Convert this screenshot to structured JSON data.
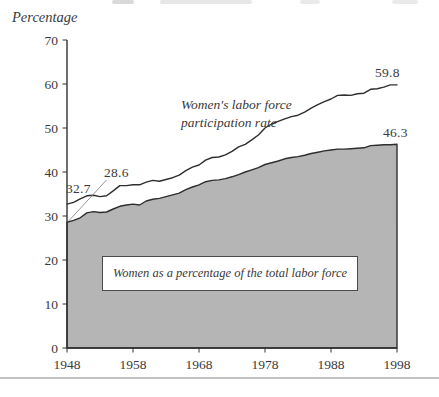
{
  "figure": {
    "ylabel": "Percentage",
    "line_label": "Women's labor force\nparticipation rate",
    "annotations": {
      "line_start": "32.7",
      "area_start": "28.6",
      "line_end": "59.8",
      "area_end": "46.3"
    },
    "caption": "Women as a percentage of the total labor force"
  },
  "chart_data": {
    "type": "area",
    "title": "",
    "xlabel": "",
    "ylabel": "Percentage",
    "xlim": [
      1948,
      1998
    ],
    "ylim": [
      0,
      70
    ],
    "x_start": 1948,
    "x_step": 1,
    "x_label_ticks": [
      1948,
      1958,
      1968,
      1978,
      1988,
      1998
    ],
    "y_ticks": [
      0,
      10,
      20,
      30,
      40,
      50,
      60,
      70
    ],
    "grid": false,
    "legend": "inline-annotations",
    "series": [
      {
        "name": "Women's labor force participation rate",
        "style": "line",
        "endpoint_labels": {
          "first": 32.7,
          "last": 59.8
        },
        "values": [
          32.7,
          33.1,
          33.9,
          34.6,
          34.7,
          34.4,
          34.6,
          35.7,
          36.9,
          36.9,
          37.1,
          37.1,
          37.7,
          38.1,
          37.9,
          38.3,
          38.7,
          39.3,
          40.3,
          41.1,
          41.6,
          42.7,
          43.3,
          43.4,
          43.9,
          44.7,
          45.7,
          46.3,
          47.3,
          48.4,
          50.0,
          50.9,
          51.5,
          52.1,
          52.6,
          52.9,
          53.6,
          54.5,
          55.3,
          56.0,
          56.6,
          57.4,
          57.5,
          57.4,
          57.8,
          57.9,
          58.8,
          58.9,
          59.3,
          59.8,
          59.8
        ]
      },
      {
        "name": "Women as a percentage of the total labor force",
        "style": "filled-area",
        "endpoint_labels": {
          "first": 28.6,
          "last": 46.3
        },
        "values": [
          28.6,
          29.0,
          29.6,
          30.7,
          31.0,
          30.8,
          30.9,
          31.6,
          32.2,
          32.5,
          32.7,
          32.5,
          33.4,
          33.8,
          34.0,
          34.4,
          34.8,
          35.2,
          36.0,
          36.6,
          37.1,
          37.8,
          38.1,
          38.2,
          38.5,
          38.9,
          39.4,
          40.0,
          40.5,
          41.0,
          41.7,
          42.1,
          42.5,
          43.0,
          43.3,
          43.5,
          43.8,
          44.2,
          44.5,
          44.8,
          45.0,
          45.2,
          45.2,
          45.3,
          45.4,
          45.5,
          46.0,
          46.1,
          46.2,
          46.2,
          46.3
        ]
      }
    ],
    "colors": {
      "area_fill": "#b5b5b5",
      "stroke": "#2e2e2e",
      "axis": "#333333",
      "text": "#3a3a3a",
      "leader": "#8a8a8a",
      "bottom_rule": "#c2c2c2"
    }
  }
}
